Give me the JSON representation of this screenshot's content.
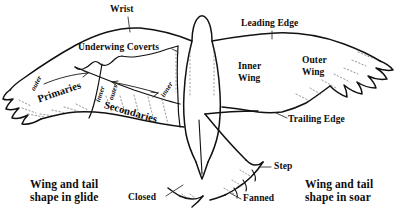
{
  "diagram": {
    "ink_color": "#111111",
    "background_color": "#ffffff",
    "labels": {
      "wrist": "Wrist",
      "underwing_coverts": "Underwing Coverts",
      "leading_edge": "Leading Edge",
      "trailing_edge": "Trailing Edge",
      "inner_wing": "Inner\nWing",
      "inner_wing_line1": "Inner",
      "inner_wing_line2": "Wing",
      "outer_wing_line1": "Outer",
      "outer_wing_line2": "Wing",
      "primaries": "Primaries",
      "secondaries": "Secondaries",
      "primaries_outer": "outer",
      "primaries_inner": "inner",
      "secondaries_outer": "outer",
      "secondaries_inner": "inner",
      "step": "Step",
      "closed": "Closed",
      "fanned": "Fanned"
    },
    "captions": {
      "glide_line1": "Wing and tail",
      "glide_line2": "shape in glide",
      "soar_line1": "Wing and tail",
      "soar_line2": "shape in soar"
    },
    "icons": {
      "wrist_leader": "leader-line-icon",
      "coverts_leader": "leader-line-icon",
      "leading_edge_leader": "leader-line-icon",
      "trailing_edge_leader": "leader-line-icon",
      "step_leader": "leader-line-icon",
      "closed_leader": "leader-line-icon",
      "fanned_leader": "leader-line-icon",
      "primaries_range_arrow": "double-arrow-icon",
      "secondaries_range_arrow": "double-arrow-icon"
    }
  }
}
